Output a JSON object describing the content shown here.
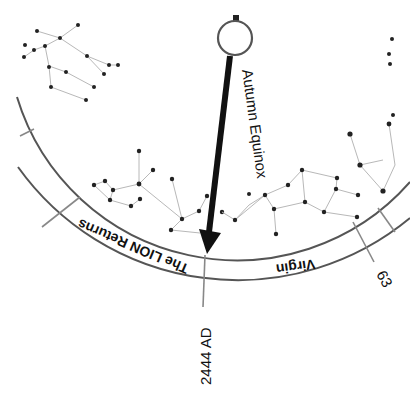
{
  "diagram": {
    "marker": {
      "label": "Autumn Equinox",
      "pointer_color": "#111111"
    },
    "ring_segments": [
      {
        "label": "The LION Returns"
      },
      {
        "label": "Virgin"
      }
    ],
    "dates": [
      {
        "label": "2444 AD"
      },
      {
        "label": "63"
      }
    ],
    "colors": {
      "ring": "#555555",
      "constellation_lines": "#b8b8b8",
      "stars": "#222222",
      "background": "#ffffff"
    }
  }
}
